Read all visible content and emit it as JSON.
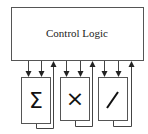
{
  "diagram": {
    "control_block": {
      "label": "Control Logic"
    },
    "units": [
      {
        "name": "sum",
        "symbol": "Σ"
      },
      {
        "name": "multiply",
        "symbol": "×"
      },
      {
        "name": "divide",
        "symbol": "/"
      }
    ],
    "colors": {
      "stroke": "#444444",
      "background": "#ffffff"
    }
  }
}
